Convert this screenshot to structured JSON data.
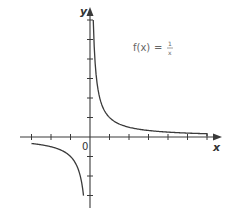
{
  "chart_data": {
    "type": "line",
    "title": "",
    "annotation": "f(x) = 1/x",
    "annotation_parts": {
      "lhs": "f(x)",
      "eq": "=",
      "num": "1",
      "den": "x"
    },
    "xlabel": "x",
    "ylabel": "y",
    "origin_label": "0",
    "xlim": [
      -4.5,
      6.5
    ],
    "ylim": [
      -3.5,
      6.5
    ],
    "x_ticks": [
      -3,
      -2,
      -1,
      1,
      2,
      3,
      4,
      5,
      6
    ],
    "y_ticks": [
      -3,
      -2,
      -1,
      1,
      2,
      3,
      4,
      5,
      6
    ],
    "grid": false,
    "series": [
      {
        "name": "f(x) = 1/x (x > 0)",
        "x": [
          0.167,
          0.2,
          0.25,
          0.333,
          0.5,
          0.75,
          1,
          1.5,
          2,
          3,
          4,
          5,
          6
        ],
        "y": [
          6,
          5,
          4,
          3,
          2,
          1.333,
          1,
          0.667,
          0.5,
          0.333,
          0.25,
          0.2,
          0.167
        ]
      },
      {
        "name": "f(x) = 1/x (x < 0)",
        "x": [
          -3,
          -2.5,
          -2,
          -1.5,
          -1,
          -0.75,
          -0.5,
          -0.4,
          -0.333
        ],
        "y": [
          -0.333,
          -0.4,
          -0.5,
          -0.667,
          -1,
          -1.333,
          -2,
          -2.5,
          -3
        ]
      }
    ]
  },
  "labels": {
    "x_axis": "x",
    "y_axis": "y",
    "origin": "0",
    "fn_lhs": "f(x)",
    "fn_eq": "=",
    "fn_num": "1",
    "fn_den": "x"
  }
}
